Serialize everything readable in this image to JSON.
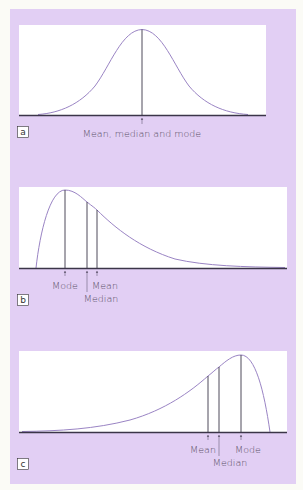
{
  "colors": {
    "page_background": "#fbfbf6",
    "panel_background": "#e2cff4",
    "plot_background": "#ffffff",
    "curve": "#9a84c4",
    "axis": "#3b3548",
    "marker_lines": "#3b3548",
    "text": "#5a4f66"
  },
  "panels": [
    {
      "id": "a",
      "label": "a",
      "description": "Symmetrical (normal) distribution",
      "annotations": [
        {
          "text": "Mean, median and mode",
          "position": "center"
        }
      ]
    },
    {
      "id": "b",
      "label": "b",
      "description": "Positively skewed distribution",
      "annotations": [
        {
          "text": "Mode"
        },
        {
          "text": "Mean"
        },
        {
          "text": "Median"
        }
      ]
    },
    {
      "id": "c",
      "label": "c",
      "description": "Negatively skewed distribution",
      "annotations": [
        {
          "text": "Mean"
        },
        {
          "text": "Mode"
        },
        {
          "text": "Median"
        }
      ]
    }
  ]
}
